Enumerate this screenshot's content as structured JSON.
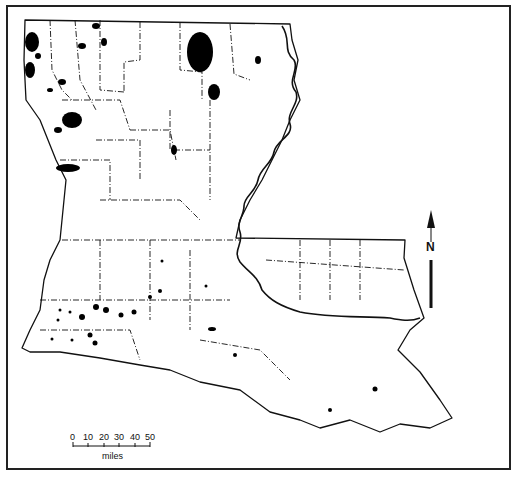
{
  "map": {
    "subject": "Louisiana parish distribution map",
    "ink_color": "#111111",
    "paper_color": "#ffffff"
  },
  "north_arrow": {
    "label": "N"
  },
  "scale_bar": {
    "ticks": [
      "0",
      "10",
      "20",
      "30",
      "40",
      "50"
    ],
    "unit": "miles"
  }
}
